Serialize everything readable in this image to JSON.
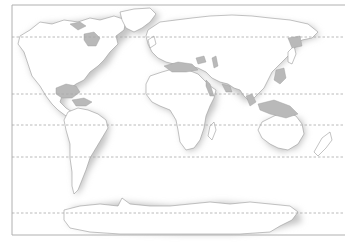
{
  "map": {
    "type": "world-outline",
    "projection": "cylindrical",
    "colors": {
      "background": "#ffffff",
      "land": "#ffffff",
      "land_shadow": "#c8c8c8",
      "water_inland": "#b9b9b9",
      "coastline": "#9a9a9a",
      "frame": "#b0b0b0",
      "gridline": "#a8a8a8"
    },
    "frame": {
      "x": 12,
      "y": 5,
      "width": 333,
      "height": 230
    },
    "latitude_lines_y": [
      37,
      94,
      125,
      157,
      213
    ],
    "regions": [
      "north-america",
      "greenland",
      "south-america",
      "europe",
      "africa",
      "asia",
      "arabia",
      "india",
      "southeast-asia",
      "indonesia",
      "australia",
      "new-zealand",
      "madagascar",
      "antarctica",
      "japan",
      "uk"
    ]
  }
}
